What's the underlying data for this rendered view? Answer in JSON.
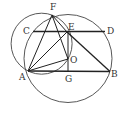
{
  "diagram": {
    "type": "geometry",
    "points": {
      "A": {
        "label": "A",
        "x": 28,
        "y": 71
      },
      "B": {
        "label": "B",
        "x": 110,
        "y": 72
      },
      "C": {
        "label": "C",
        "x": 33,
        "y": 31
      },
      "D": {
        "label": "D",
        "x": 105,
        "y": 31
      },
      "E": {
        "label": "E",
        "x": 67,
        "y": 32
      },
      "F": {
        "label": "F",
        "x": 52,
        "y": 15
      },
      "O": {
        "label": "O",
        "x": 68,
        "y": 59
      },
      "G": {
        "label": "G",
        "x": 68,
        "y": 72
      }
    },
    "circles": [
      {
        "name": "circle-O",
        "cx": 68,
        "cy": 59,
        "r": 44
      },
      {
        "name": "circle-AFEO",
        "cx": 41.6,
        "cy": 43.7,
        "r": 30.5
      }
    ],
    "segments": [
      "CD",
      "AB",
      "AF",
      "AE",
      "AO",
      "FE",
      "FO",
      "EB",
      "EG"
    ]
  }
}
